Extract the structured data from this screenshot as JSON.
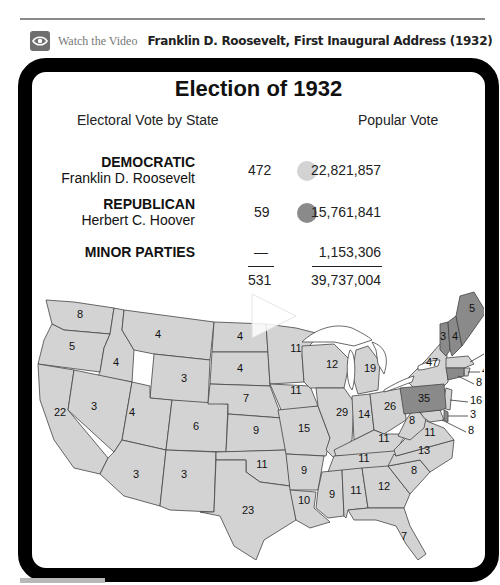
{
  "header": {
    "icon": "eye-icon",
    "watch_label": "Watch the Video",
    "video_title": "Franklin D. Roosevelt, First Inaugural Address (1932)"
  },
  "figure": {
    "title": "Election of 1932",
    "electoral_header": "Electoral Vote by State",
    "popular_header": "Popular Vote",
    "colors": {
      "democratic": "#d3d3d3",
      "republican": "#8a8a8a",
      "border": "#000000"
    },
    "parties": [
      {
        "party": "DEMOCRATIC",
        "candidate": "Franklin D. Roosevelt",
        "electoral": "472",
        "popular": "22,821,857"
      },
      {
        "party": "REPUBLICAN",
        "candidate": "Herbert C. Hoover",
        "electoral": "59",
        "popular": "15,761,841"
      },
      {
        "party": "MINOR PARTIES",
        "candidate": "",
        "electoral": "—",
        "popular": "1,153,306"
      }
    ],
    "totals": {
      "electoral": "531",
      "popular": "39,737,004"
    },
    "play_icon": "play-icon"
  },
  "map": {
    "states": [
      {
        "name": "WA",
        "ev": "8",
        "party": "D"
      },
      {
        "name": "OR",
        "ev": "5",
        "party": "D"
      },
      {
        "name": "CA",
        "ev": "22",
        "party": "D"
      },
      {
        "name": "ID",
        "ev": "4",
        "party": "D"
      },
      {
        "name": "NV",
        "ev": "3",
        "party": "D"
      },
      {
        "name": "MT",
        "ev": "4",
        "party": "D"
      },
      {
        "name": "WY",
        "ev": "3",
        "party": "D"
      },
      {
        "name": "UT",
        "ev": "4",
        "party": "D"
      },
      {
        "name": "AZ",
        "ev": "3",
        "party": "D"
      },
      {
        "name": "CO",
        "ev": "6",
        "party": "D"
      },
      {
        "name": "NM",
        "ev": "3",
        "party": "D"
      },
      {
        "name": "ND",
        "ev": "4",
        "party": "D"
      },
      {
        "name": "SD",
        "ev": "4",
        "party": "D"
      },
      {
        "name": "NE",
        "ev": "7",
        "party": "D"
      },
      {
        "name": "KS",
        "ev": "9",
        "party": "D"
      },
      {
        "name": "OK",
        "ev": "11",
        "party": "D"
      },
      {
        "name": "TX",
        "ev": "23",
        "party": "D"
      },
      {
        "name": "MN",
        "ev": "11",
        "party": "D"
      },
      {
        "name": "IA",
        "ev": "11",
        "party": "D"
      },
      {
        "name": "MO",
        "ev": "15",
        "party": "D"
      },
      {
        "name": "AR",
        "ev": "9",
        "party": "D"
      },
      {
        "name": "LA",
        "ev": "10",
        "party": "D"
      },
      {
        "name": "WI",
        "ev": "12",
        "party": "D"
      },
      {
        "name": "IL",
        "ev": "29",
        "party": "D"
      },
      {
        "name": "MI",
        "ev": "19",
        "party": "D"
      },
      {
        "name": "IN",
        "ev": "14",
        "party": "D"
      },
      {
        "name": "OH",
        "ev": "26",
        "party": "D"
      },
      {
        "name": "KY",
        "ev": "11",
        "party": "D"
      },
      {
        "name": "TN",
        "ev": "11",
        "party": "D"
      },
      {
        "name": "MS",
        "ev": "9",
        "party": "D"
      },
      {
        "name": "AL",
        "ev": "11",
        "party": "D"
      },
      {
        "name": "GA",
        "ev": "12",
        "party": "D"
      },
      {
        "name": "FL",
        "ev": "7",
        "party": "D"
      },
      {
        "name": "SC",
        "ev": "8",
        "party": "D"
      },
      {
        "name": "NC",
        "ev": "13",
        "party": "D"
      },
      {
        "name": "VA",
        "ev": "11",
        "party": "D"
      },
      {
        "name": "WV",
        "ev": "8",
        "party": "D"
      },
      {
        "name": "PA",
        "ev": "35",
        "party": "R"
      },
      {
        "name": "NY",
        "ev": "47",
        "party": "D"
      },
      {
        "name": "VT",
        "ev": "3",
        "party": "R"
      },
      {
        "name": "NH",
        "ev": "4",
        "party": "R"
      },
      {
        "name": "ME",
        "ev": "5",
        "party": "R"
      },
      {
        "name": "MA",
        "ev": "17",
        "party": "D"
      },
      {
        "name": "RI",
        "ev": "4",
        "party": "D"
      },
      {
        "name": "CT",
        "ev": "8",
        "party": "R"
      },
      {
        "name": "NJ",
        "ev": "16",
        "party": "D"
      },
      {
        "name": "DE",
        "ev": "3",
        "party": "R"
      },
      {
        "name": "MD",
        "ev": "8",
        "party": "D"
      }
    ]
  }
}
